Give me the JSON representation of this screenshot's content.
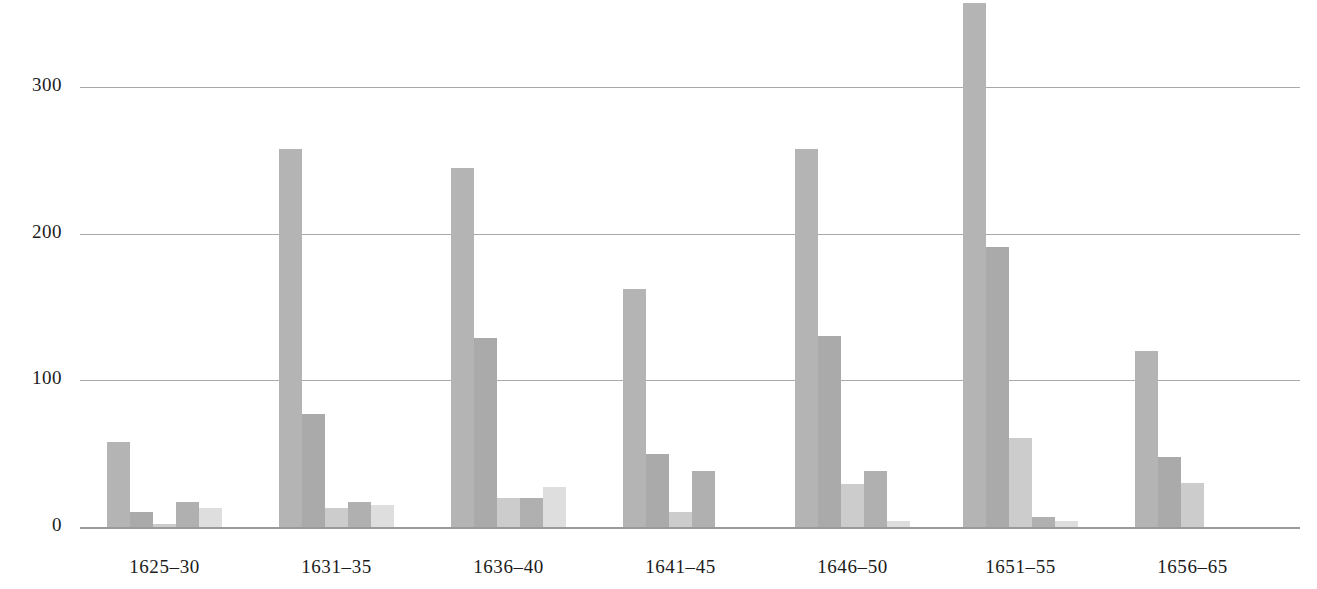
{
  "chart_data": {
    "type": "bar",
    "title": "",
    "subtitle": "",
    "xlabel": "",
    "ylabel": "",
    "grid": true,
    "legend": "none",
    "ylim": [
      0,
      360
    ],
    "yticks": [
      0,
      100,
      200,
      300
    ],
    "ytick_labels": [
      "0",
      "100",
      "200",
      "300"
    ],
    "categories": [
      "1625–30",
      "1631–35",
      "1636–40",
      "1641–45",
      "1646–50",
      "1651–55",
      "1656–65"
    ],
    "series": [
      {
        "name": "series-1",
        "color": "#b4b4b4",
        "values": [
          58,
          258,
          245,
          162,
          258,
          357,
          120
        ]
      },
      {
        "name": "series-2",
        "color": "#aaaaaa",
        "values": [
          10,
          77,
          129,
          50,
          130,
          191,
          48
        ]
      },
      {
        "name": "series-3",
        "color": "#cccccc",
        "values": [
          2,
          13,
          20,
          10,
          29,
          61,
          30
        ]
      },
      {
        "name": "series-4",
        "color": "#b0b0b0",
        "values": [
          17,
          17,
          20,
          38,
          38,
          7,
          0
        ]
      },
      {
        "name": "series-5",
        "color": "#dedede",
        "values": [
          13,
          15,
          27,
          0,
          4,
          4,
          0
        ]
      }
    ]
  },
  "layout": {
    "plot_left": 80,
    "plot_right": 1300,
    "baseline_y": 527,
    "y_top_value": 360,
    "group_width": 120,
    "bar_width": 23,
    "xlabel_y": 556
  }
}
